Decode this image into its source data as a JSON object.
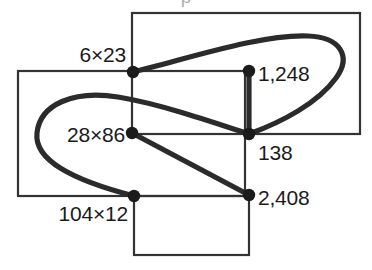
{
  "figure": {
    "title_cropped": "p",
    "background_color": "#ffffff",
    "stroke_color": "#2b2b2b",
    "thin_stroke_color": "#333333",
    "node_color": "#1b1b1b",
    "text_color": "#1b1b1b",
    "width": 372,
    "height": 270,
    "nodes": [
      {
        "id": "n1",
        "label": "6×23",
        "x": 133,
        "y": 72,
        "label_x": 126,
        "label_y": 54,
        "align": "left"
      },
      {
        "id": "n2",
        "label": "1,248",
        "x": 249,
        "y": 71,
        "label_x": 258,
        "label_y": 73,
        "align": "right"
      },
      {
        "id": "n3",
        "label": "28×86",
        "x": 132,
        "y": 133,
        "label_x": 125,
        "label_y": 134,
        "align": "left"
      },
      {
        "id": "n4",
        "label": "138",
        "x": 249,
        "y": 134,
        "label_x": 258,
        "label_y": 152,
        "align": "right"
      },
      {
        "id": "n5",
        "label": "104×12",
        "x": 134,
        "y": 196,
        "label_x": 128,
        "label_y": 213,
        "align": "left"
      },
      {
        "id": "n6",
        "label": "2,408",
        "x": 249,
        "y": 195,
        "label_x": 258,
        "label_y": 197,
        "align": "right"
      }
    ],
    "rectangles": [
      {
        "id": "rect-upper-right",
        "x": 132,
        "y": 13,
        "width": 228,
        "height": 121
      },
      {
        "id": "rect-left",
        "x": 18,
        "y": 71,
        "width": 227,
        "height": 125
      },
      {
        "id": "rect-bottom",
        "x": 134,
        "y": 196,
        "width": 115,
        "height": 59
      }
    ],
    "curves": [
      {
        "id": "curve-right-loop",
        "path": "M 133 72 C 190 58 262 34 308 36 C 340 37 352 56 336 78 C 318 103 282 122 249 134"
      },
      {
        "id": "curve-left-loop",
        "path": "M 249 134 C 210 121 160 104 118 97 C 74 90 40 104 37 133 C 34 160 72 180 134 196"
      }
    ],
    "segments": [
      {
        "id": "seg-1248-to-138",
        "x1": 249,
        "y1": 71,
        "x2": 249,
        "y2": 134
      },
      {
        "id": "seg-2886-to-2408",
        "x1": 132,
        "y1": 133,
        "x2": 249,
        "y2": 195
      }
    ]
  }
}
